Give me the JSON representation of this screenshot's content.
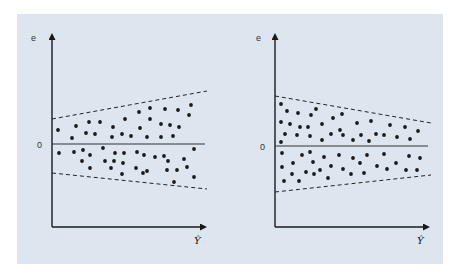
{
  "chart_data": [
    {
      "type": "scatter",
      "title": "",
      "description": "Residual plot: heteroscedasticity with variance increasing as fitted value grows (funnel opening right)",
      "xlabel": "Ŷ",
      "ylabel": "e",
      "zero_label": "0",
      "grid": false,
      "legend": null,
      "pixel_frame": {
        "x0": 52,
        "y_axis_top": 33,
        "x_axis_y": 227,
        "x_end": 207,
        "zero_y": 144
      },
      "envelope": {
        "style": "dashed",
        "upper": [
          [
            52,
            119
          ],
          [
            207,
            91
          ]
        ],
        "lower": [
          [
            52,
            173
          ],
          [
            207,
            189
          ]
        ]
      },
      "points": [
        [
          58,
          130
        ],
        [
          76,
          126
        ],
        [
          72,
          138
        ],
        [
          89,
          122
        ],
        [
          86,
          133
        ],
        [
          95,
          134
        ],
        [
          100,
          122
        ],
        [
          113,
          127
        ],
        [
          112,
          137
        ],
        [
          122,
          134
        ],
        [
          125,
          119
        ],
        [
          131,
          136
        ],
        [
          139,
          112
        ],
        [
          140,
          128
        ],
        [
          147,
          137
        ],
        [
          150,
          108
        ],
        [
          150,
          119
        ],
        [
          161,
          124
        ],
        [
          161,
          137
        ],
        [
          165,
          109
        ],
        [
          170,
          125
        ],
        [
          173,
          136
        ],
        [
          178,
          110
        ],
        [
          179,
          127
        ],
        [
          189,
          115
        ],
        [
          191,
          105
        ],
        [
          59,
          153
        ],
        [
          74,
          152
        ],
        [
          83,
          150
        ],
        [
          90,
          155
        ],
        [
          82,
          161
        ],
        [
          90,
          168
        ],
        [
          103,
          148
        ],
        [
          105,
          161
        ],
        [
          111,
          168
        ],
        [
          114,
          161
        ],
        [
          115,
          153
        ],
        [
          122,
          174
        ],
        [
          123,
          163
        ],
        [
          124,
          153
        ],
        [
          136,
          168
        ],
        [
          137,
          152
        ],
        [
          143,
          173
        ],
        [
          144,
          155
        ],
        [
          147,
          171
        ],
        [
          155,
          157
        ],
        [
          164,
          156
        ],
        [
          167,
          170
        ],
        [
          168,
          161
        ],
        [
          174,
          182
        ],
        [
          177,
          170
        ],
        [
          184,
          159
        ],
        [
          187,
          167
        ],
        [
          194,
          149
        ],
        [
          194,
          177
        ]
      ]
    },
    {
      "type": "scatter",
      "title": "",
      "description": "Residual plot: heteroscedasticity with variance decreasing as fitted value grows (funnel narrowing right)",
      "xlabel": "Ŷ",
      "ylabel": "e",
      "zero_label": "0",
      "grid": false,
      "legend": null,
      "pixel_frame": {
        "x0": 275,
        "y_axis_top": 33,
        "x_axis_y": 227,
        "x_end": 430,
        "zero_y": 146
      },
      "envelope": {
        "style": "dashed",
        "upper": [
          [
            275,
            96
          ],
          [
            431,
            123
          ]
        ],
        "lower": [
          [
            275,
            192
          ],
          [
            431,
            175
          ]
        ]
      },
      "points": [
        [
          281,
          104
        ],
        [
          287,
          111
        ],
        [
          281,
          122
        ],
        [
          298,
          113
        ],
        [
          311,
          115
        ],
        [
          316,
          109
        ],
        [
          290,
          124
        ],
        [
          285,
          134
        ],
        [
          281,
          142
        ],
        [
          300,
          127
        ],
        [
          308,
          127
        ],
        [
          322,
          124
        ],
        [
          297,
          135
        ],
        [
          310,
          136
        ],
        [
          322,
          140
        ],
        [
          333,
          118
        ],
        [
          342,
          114
        ],
        [
          340,
          130
        ],
        [
          331,
          134
        ],
        [
          343,
          135
        ],
        [
          353,
          140
        ],
        [
          357,
          123
        ],
        [
          361,
          135
        ],
        [
          371,
          121
        ],
        [
          369,
          141
        ],
        [
          376,
          134
        ],
        [
          384,
          135
        ],
        [
          390,
          125
        ],
        [
          397,
          137
        ],
        [
          405,
          127
        ],
        [
          410,
          139
        ],
        [
          418,
          131
        ],
        [
          282,
          153
        ],
        [
          282,
          167
        ],
        [
          284,
          181
        ],
        [
          293,
          163
        ],
        [
          292,
          174
        ],
        [
          299,
          181
        ],
        [
          302,
          155
        ],
        [
          306,
          172
        ],
        [
          310,
          152
        ],
        [
          313,
          162
        ],
        [
          314,
          174
        ],
        [
          320,
          170
        ],
        [
          324,
          157
        ],
        [
          328,
          178
        ],
        [
          331,
          166
        ],
        [
          339,
          155
        ],
        [
          343,
          169
        ],
        [
          351,
          174
        ],
        [
          353,
          158
        ],
        [
          360,
          163
        ],
        [
          364,
          173
        ],
        [
          367,
          155
        ],
        [
          377,
          166
        ],
        [
          384,
          154
        ],
        [
          387,
          169
        ],
        [
          396,
          163
        ],
        [
          406,
          170
        ],
        [
          409,
          156
        ],
        [
          417,
          170
        ],
        [
          420,
          158
        ]
      ]
    }
  ],
  "colors": {
    "panel_bg": "#dde6ef",
    "ink": "#1a1a1a",
    "page_bg": "#ffffff"
  }
}
